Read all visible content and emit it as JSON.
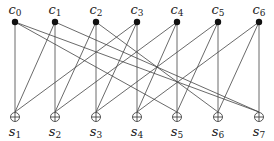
{
  "diagram": {
    "type": "bipartite-graph",
    "colors": {
      "line": "#444444",
      "node": "#111111",
      "label": "#222222",
      "background": "#ffffff"
    },
    "top_nodes": [
      {
        "id": "c0",
        "base": "c",
        "sub": "0",
        "x": 15,
        "y": 22
      },
      {
        "id": "c1",
        "base": "c",
        "sub": "1",
        "x": 55,
        "y": 22
      },
      {
        "id": "c2",
        "base": "c",
        "sub": "2",
        "x": 96,
        "y": 22
      },
      {
        "id": "c3",
        "base": "c",
        "sub": "3",
        "x": 137,
        "y": 22
      },
      {
        "id": "c4",
        "base": "c",
        "sub": "4",
        "x": 177,
        "y": 22
      },
      {
        "id": "c5",
        "base": "c",
        "sub": "5",
        "x": 218,
        "y": 22
      },
      {
        "id": "c6",
        "base": "c",
        "sub": "6",
        "x": 259,
        "y": 22
      }
    ],
    "top_node_style": "filled-circle",
    "bottom_nodes": [
      {
        "id": "s1",
        "base": "s",
        "sub": "1",
        "x": 15,
        "y": 117
      },
      {
        "id": "s2",
        "base": "s",
        "sub": "2",
        "x": 55,
        "y": 117
      },
      {
        "id": "s3",
        "base": "s",
        "sub": "3",
        "x": 96,
        "y": 117
      },
      {
        "id": "s4",
        "base": "s",
        "sub": "4",
        "x": 137,
        "y": 117
      },
      {
        "id": "s5",
        "base": "s",
        "sub": "5",
        "x": 177,
        "y": 117
      },
      {
        "id": "s6",
        "base": "s",
        "sub": "6",
        "x": 218,
        "y": 117
      },
      {
        "id": "s7",
        "base": "s",
        "sub": "7",
        "x": 259,
        "y": 117
      }
    ],
    "bottom_node_style": "circled-plus",
    "edges": [
      [
        "c0",
        "s1"
      ],
      [
        "c0",
        "s5"
      ],
      [
        "c0",
        "s7"
      ],
      [
        "c1",
        "s1"
      ],
      [
        "c1",
        "s2"
      ],
      [
        "c1",
        "s7"
      ],
      [
        "c2",
        "s2"
      ],
      [
        "c2",
        "s3"
      ],
      [
        "c2",
        "s6"
      ],
      [
        "c3",
        "s1"
      ],
      [
        "c3",
        "s3"
      ],
      [
        "c3",
        "s4"
      ],
      [
        "c4",
        "s2"
      ],
      [
        "c4",
        "s4"
      ],
      [
        "c4",
        "s5"
      ],
      [
        "c5",
        "s3"
      ],
      [
        "c5",
        "s5"
      ],
      [
        "c5",
        "s6"
      ],
      [
        "c6",
        "s4"
      ],
      [
        "c6",
        "s6"
      ],
      [
        "c6",
        "s7"
      ]
    ]
  }
}
